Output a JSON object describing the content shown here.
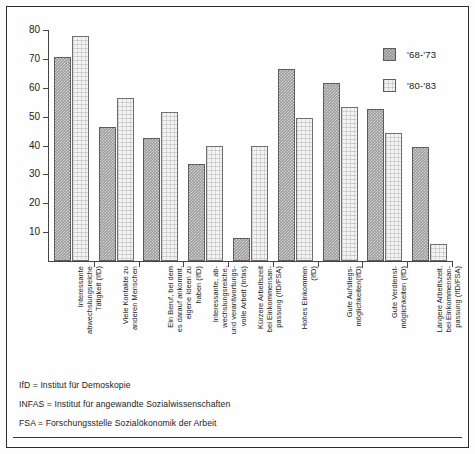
{
  "chart_data": {
    "type": "bar",
    "title": "",
    "subtitle": "",
    "xlabel": "",
    "ylabel": "",
    "ylim": [
      0,
      80
    ],
    "yticks": [
      10,
      20,
      30,
      40,
      50,
      60,
      70,
      80
    ],
    "grid": false,
    "legend_position": "top-right",
    "categories": [
      "Interessante\nabwechslungsreiche\nTätigkeit (IfD)",
      "Viele Kontakte zu\nanderen Menschen",
      "Ein Beruf, bei dem\nes darauf ankommt,\neigene Ideen zu\nhaben (IfD)",
      "Interessante, ab-\nwechslungsreiche,\nund verantwortungs-\nvolle Arbeit (Infas)",
      "Kürzere Arbeitszeit\nbei Einkommensan-\npassung (IfD/FSA)",
      "Hohes Einkommen\n(IfD)",
      "Gute Aufstiegs-\nmöglichkeiten(IfD)",
      "Gute Verdienst-\nmöglichkeiten (IfD)",
      "Längere Arbeitszeit,\nbei Einkommensan-\npassung (IfD/FSA)"
    ],
    "series": [
      {
        "name": "'68-'73",
        "color": "#8f8f8f",
        "values": [
          70.5,
          46.5,
          42.5,
          33.5,
          8,
          66.5,
          61.5,
          52.5,
          39.5
        ]
      },
      {
        "name": "'80-'83",
        "color": "#f2f2f2",
        "values": [
          78,
          56.5,
          51.5,
          40,
          40,
          49.5,
          53.5,
          44.5,
          6
        ]
      }
    ]
  },
  "legend": {
    "items": [
      {
        "label": "'68-'73",
        "swatch": "dark-hatched-swatch"
      },
      {
        "label": "'80-'83",
        "swatch": "light-dotted-swatch"
      }
    ]
  },
  "notes": [
    "IfD = Institut für Demoskopie",
    "INFAS = Institut für angewandte Sozialwissenschaften",
    "FSA = Forschungsstelle Sozialökonomik der Arbeit"
  ]
}
